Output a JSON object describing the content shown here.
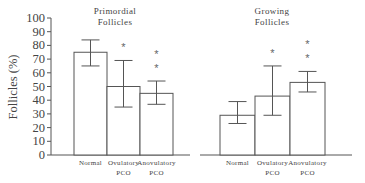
{
  "chart_data": [
    {
      "type": "bar",
      "title": "Primordial Follicles",
      "title_lines": [
        "Primordial",
        "Follicles"
      ],
      "ylabel": "Follicles (%)",
      "xlabel": "",
      "ylim": [
        0,
        100
      ],
      "yticks": [
        0,
        10,
        20,
        30,
        40,
        50,
        60,
        70,
        80,
        90,
        100
      ],
      "categories": [
        "Normal",
        "Ovulatory PCO",
        "Anovulatory PCO"
      ],
      "category_lines": [
        [
          "Normal"
        ],
        [
          "Ovulatory",
          "PCO"
        ],
        [
          "Anovulatory",
          "PCO"
        ]
      ],
      "values": [
        75,
        50,
        45
      ],
      "error_upper": [
        84,
        69,
        54
      ],
      "error_lower": [
        65,
        35,
        37
      ],
      "significance": [
        "",
        "*",
        "**"
      ],
      "grid": false
    },
    {
      "type": "bar",
      "title": "Growing Follicles",
      "title_lines": [
        "Growing",
        "Follicles"
      ],
      "ylabel": "Follicles (%)",
      "xlabel": "",
      "ylim": [
        0,
        100
      ],
      "categories": [
        "Normal",
        "Ovulatory PCO",
        "Anovulatory PCO"
      ],
      "category_lines": [
        [
          "Normal"
        ],
        [
          "Ovulatory",
          "PCO"
        ],
        [
          "Anovulatory",
          "PCO"
        ]
      ],
      "values": [
        29,
        43,
        53
      ],
      "error_upper": [
        39,
        65,
        61
      ],
      "error_lower": [
        23,
        29,
        46
      ],
      "significance": [
        "",
        "*",
        "**"
      ],
      "grid": false
    }
  ]
}
